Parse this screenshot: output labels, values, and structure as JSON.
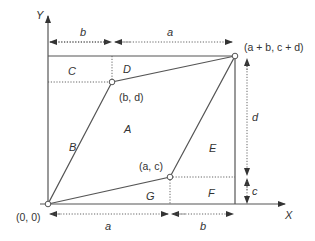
{
  "diagram": {
    "axes": {
      "x_label": "X",
      "y_label": "Y"
    },
    "points": {
      "origin": "(0, 0)",
      "bd": "(b, d)",
      "ac": "(a, c)",
      "sum": "(a + b, c + d)"
    },
    "regions": [
      "A",
      "B",
      "C",
      "D",
      "E",
      "F",
      "G"
    ],
    "dimensions": {
      "top_b": "b",
      "top_a": "a",
      "right_d": "d",
      "right_c": "c",
      "bottom_a": "a",
      "bottom_b": "b"
    },
    "colors": {
      "line": "#555555",
      "text": "#333333",
      "background": "#ffffff"
    }
  }
}
